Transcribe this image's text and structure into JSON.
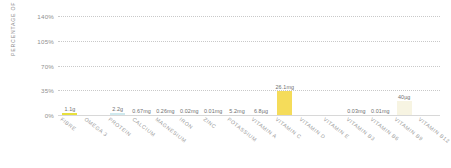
{
  "chart_data": {
    "type": "bar",
    "title": "",
    "xlabel": "",
    "ylabel": "PERCENTAGE OF RDA",
    "ylim": [
      0,
      140
    ],
    "yticks": [
      "0%",
      "35%",
      "70%",
      "105%",
      "140%"
    ],
    "ytick_values": [
      0,
      35,
      70,
      105,
      140
    ],
    "grid": true,
    "legend": "none",
    "categories": [
      "FIBRE",
      "OMEGA 3",
      "PROTEIN",
      "CALCIUM",
      "MAGNESIUM",
      "IRON",
      "ZINC",
      "POTASSIUM",
      "VITAMIN A",
      "VITAMIN C",
      "VITAMIN D",
      "VITAMIN E",
      "VITAMIN B3",
      "VITAMIN B6",
      "VITAMIN B9",
      "VITAMIN B12"
    ],
    "values": [
      2.5,
      0,
      1.8,
      0,
      0,
      0,
      0,
      0,
      0,
      34,
      0,
      0,
      0,
      0,
      20,
      0
    ],
    "data_labels": [
      "1.1g",
      "",
      "2.2g",
      "0.67mg",
      "0.26mg",
      "0.02mg",
      "0.01mg",
      "5.2mg",
      "6.8µg",
      "26.1mg",
      "",
      "",
      "0.03mg",
      "0.01mg",
      "40µg",
      ""
    ],
    "bar_colors": [
      "#e8e03c",
      "#ffffff",
      "#cfe9ee",
      "#ffffff",
      "#ffffff",
      "#ffffff",
      "#ffffff",
      "#ffffff",
      "#ffffff",
      "#f5dc5a",
      "#ffffff",
      "#ffffff",
      "#ffffff",
      "#ffffff",
      "#f7f4e2",
      "#ffffff"
    ]
  },
  "colors": {
    "grid": "#c9c9c9",
    "axis_text": "#8f8f8f",
    "label_text": "#6f6f6f",
    "category_text": "#9a9a9a",
    "background": "#ffffff"
  }
}
